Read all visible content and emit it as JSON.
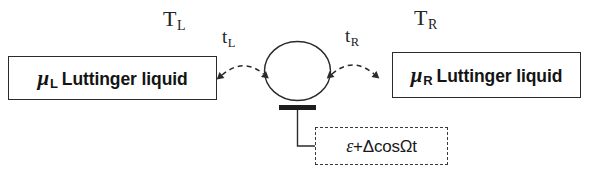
{
  "figure": {
    "type": "quantum-dot-transport-schematic",
    "background_color": "#ffffff",
    "line_color": "#2b2b2b"
  },
  "leads": {
    "left": {
      "chemical_potential_symbol": "μ",
      "chemical_potential_subscript": "L",
      "material_label": "Luttinger liquid",
      "temperature_symbol": "T",
      "temperature_subscript": "L",
      "tunneling_symbol": "t",
      "tunneling_subscript": "L"
    },
    "right": {
      "chemical_potential_symbol": "μ",
      "chemical_potential_subscript": "R",
      "material_label": "Luttinger liquid",
      "temperature_symbol": "T",
      "temperature_subscript": "R",
      "tunneling_symbol": "t",
      "tunneling_subscript": "R"
    }
  },
  "dot": {
    "shape": "circle",
    "label": ""
  },
  "gate": {
    "electrode_label": "",
    "drive_formula": "ε+ΔcosΩt",
    "drive_formula_parts": {
      "static": "ε",
      "plus": "+",
      "amplitude": "Δ",
      "function": "cos",
      "frequency": "Ω",
      "time": "t"
    }
  }
}
